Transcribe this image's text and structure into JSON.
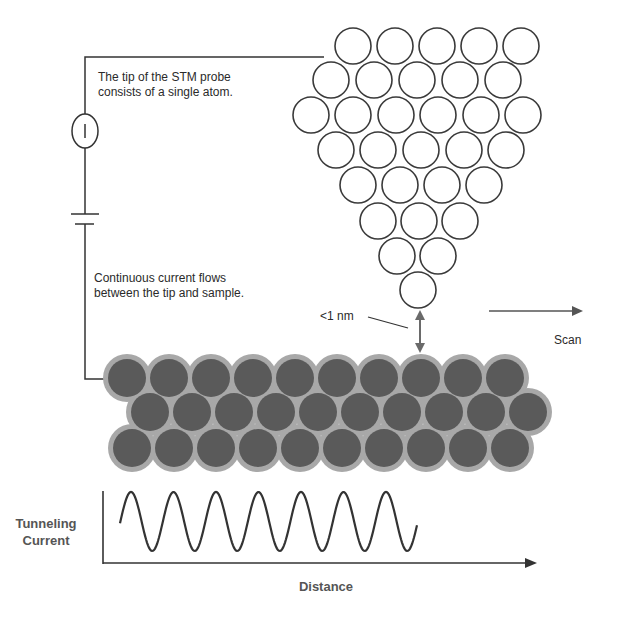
{
  "annotations": {
    "tip_note": "The tip of the STM probe\nconsists of a single atom.",
    "current_note": "Continuous current flows\nbetween the tip and sample.",
    "gap_label": "<1 nm",
    "scan_label": "Scan",
    "ammeter_symbol": "I"
  },
  "graph": {
    "ylabel": "Tunneling\nCurrent",
    "xlabel": "Distance"
  },
  "colors": {
    "line": "#333333",
    "tip_atom_stroke": "#3a3a3a",
    "sample_atom_inner": "#5a5a5a",
    "sample_atom_outer": "#a8a8a8",
    "arrow": "#6a6a6a"
  },
  "tip_atoms": {
    "radius": 18,
    "rows": [
      {
        "y": 46,
        "xs": [
          353,
          395,
          437,
          479,
          521
        ]
      },
      {
        "y": 80,
        "xs": [
          331,
          374,
          417,
          460,
          503
        ]
      },
      {
        "y": 115,
        "xs": [
          311,
          353,
          396,
          438,
          481,
          523
        ]
      },
      {
        "y": 150,
        "xs": [
          336,
          378,
          421,
          464,
          506
        ]
      },
      {
        "y": 185,
        "xs": [
          358,
          400,
          442,
          484
        ]
      },
      {
        "y": 221,
        "xs": [
          378,
          419,
          460
        ]
      },
      {
        "y": 256,
        "xs": [
          397,
          438
        ]
      },
      {
        "y": 290,
        "xs": [
          418
        ]
      }
    ]
  },
  "sample_atoms": {
    "inner_radius": 19,
    "outer_radius": 24,
    "rows": [
      {
        "y": 378,
        "x0": 127,
        "count": 10,
        "dx": 42
      },
      {
        "y": 412,
        "x0": 150,
        "count": 10,
        "dx": 42
      },
      {
        "y": 448,
        "x0": 132,
        "count": 10,
        "dx": 42
      }
    ]
  }
}
